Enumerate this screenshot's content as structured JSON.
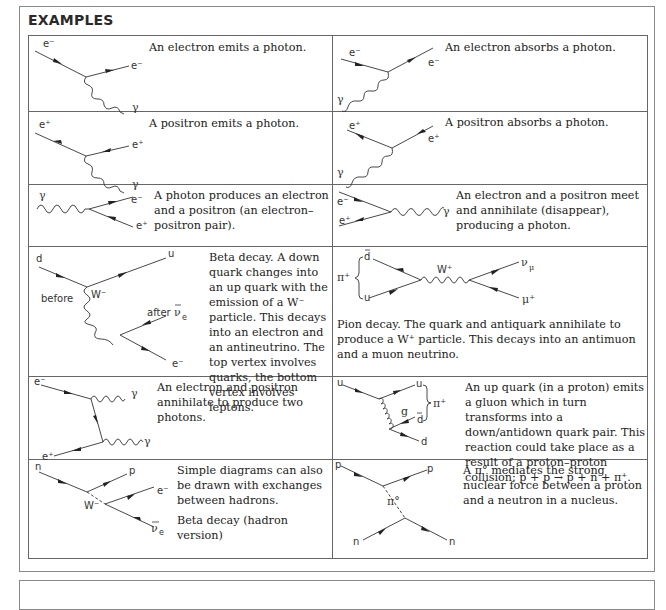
{
  "section": {
    "title": "EXAMPLES"
  },
  "examples": [
    {
      "id": "electron-emits-photon",
      "description": "An electron emits a photon.",
      "labels": {
        "in": "e⁻",
        "out": "e⁻",
        "photon": "γ"
      }
    },
    {
      "id": "electron-absorbs-photon",
      "description": "An electron absorbs a photon.",
      "labels": {
        "in": "e⁻",
        "out": "e⁻",
        "photon": "γ"
      }
    },
    {
      "id": "positron-emits-photon",
      "description": "A positron emits a photon.",
      "labels": {
        "in": "e⁺",
        "out": "e⁺",
        "photon": "γ"
      }
    },
    {
      "id": "positron-absorbs-photon",
      "description": "A positron absorbs a photon.",
      "labels": {
        "in": "e⁺",
        "out": "e⁺",
        "photon": "γ"
      }
    },
    {
      "id": "pair-production",
      "description": "A photon produces an electron and a positron (an electron–positron pair).",
      "labels": {
        "photon": "γ",
        "electron": "e⁻",
        "positron": "e⁺"
      }
    },
    {
      "id": "annihilation-one-photon",
      "description": "An electron and a positron meet and annihilate (disappear), producing a photon.",
      "labels": {
        "electron": "e⁻",
        "positron": "e⁺",
        "photon": "γ"
      }
    },
    {
      "id": "beta-decay",
      "description": "Beta decay. A down quark changes into an up quark with the emission of a W⁻ particle. This decays into an electron and an antineutrino. The top vertex involves quarks, the bottom vertex involves leptons.",
      "labels": {
        "d": "d",
        "u": "u",
        "before": "before",
        "after": "after",
        "w": "W⁻",
        "nu": "ν",
        "nu_sub": "e",
        "e": "e⁻"
      }
    },
    {
      "id": "pion-decay",
      "description": "Pion decay. The quark and antiquark annihilate to produce a W⁺ particle. This decays into an antimuon and a muon neutrino.",
      "labels": {
        "pi": "π⁺",
        "dbar": "d",
        "u": "u",
        "w": "W⁺",
        "nu": "ν",
        "nu_sub": "μ",
        "mu": "μ⁺"
      }
    },
    {
      "id": "annihilation-two-photons",
      "description": "An electron and positron annihilate to produce two photons.",
      "labels": {
        "electron": "e⁻",
        "positron": "e⁺",
        "photon1": "γ",
        "photon2": "γ"
      }
    },
    {
      "id": "gluon-pion",
      "description": "An up quark (in a proton) emits a gluon which in turn transforms into a down/antidown quark pair. This reaction could take place as a result of a proton–proton collision: p + p → p + n + π⁺.",
      "labels": {
        "u_in": "u",
        "u_out": "u",
        "g": "g",
        "dbar": "d",
        "d": "d",
        "pi": "π⁺"
      }
    },
    {
      "id": "hadron-beta-decay",
      "description": "Simple diagrams can also be drawn with exchanges between hadrons.",
      "description2": "Beta decay (hadron version)",
      "labels": {
        "n": "n",
        "p": "p",
        "w": "W⁻",
        "e": "e⁻",
        "nu": "ν",
        "nu_sub": "e"
      }
    },
    {
      "id": "pion-exchange",
      "description": "A π° mediates the strong nuclear force between a proton and a neutron in a nucleus.",
      "labels": {
        "p_in": "p",
        "p_out": "p",
        "pi": "π°",
        "n_in": "n",
        "n_out": "n"
      }
    }
  ]
}
